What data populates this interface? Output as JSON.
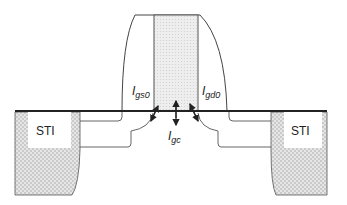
{
  "diagram": {
    "sti_left_label": "STI",
    "sti_right_label": "STI",
    "currents": {
      "igs0": {
        "main": "I",
        "sub": "gs0"
      },
      "igd0": {
        "main": "I",
        "sub": "gd0"
      },
      "igc": {
        "main": "I",
        "sub": "gc"
      }
    },
    "colors": {
      "line": "#333333",
      "fill_pattern": "#cfcfcf",
      "background": "#ffffff"
    }
  }
}
